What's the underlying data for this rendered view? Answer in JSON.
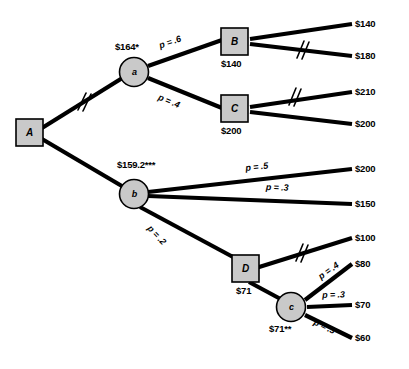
{
  "diagram": {
    "colors": {
      "node_fill": "#c9c9c9",
      "node_stroke": "#000000",
      "branch": "#000000",
      "background": "#ffffff"
    }
  },
  "nodes": {
    "A": {
      "label": "A",
      "shape": "square",
      "value": ""
    },
    "a": {
      "label": "a",
      "shape": "circle",
      "value": "$164*"
    },
    "b": {
      "label": "b",
      "shape": "circle",
      "value": "$159.2***"
    },
    "B": {
      "label": "B",
      "shape": "square",
      "value": "$140"
    },
    "C": {
      "label": "C",
      "shape": "square",
      "value": "$200"
    },
    "D": {
      "label": "D",
      "shape": "square",
      "value": "$71"
    },
    "c": {
      "label": "c",
      "shape": "circle",
      "value": "$71**"
    }
  },
  "probabilities": {
    "a_to_B": "p = .6",
    "a_to_C": "p = .4",
    "b_to_200": "p = .5",
    "b_to_150": "p = .3",
    "b_to_D": "p = .2",
    "c_to_80": "p = .4",
    "c_to_70": "p = .3",
    "c_to_60": "p = .3"
  },
  "payoffs": {
    "p140": "$140",
    "p180": "$180",
    "p210": "$210",
    "p200_c": "$200",
    "p200_b": "$200",
    "p150": "$150",
    "p100": "$100",
    "p80": "$80",
    "p70": "$70",
    "p60": "$60"
  },
  "pruned_branches": [
    "A-to-a",
    "B-to-180",
    "C-to-210",
    "D-to-100"
  ]
}
